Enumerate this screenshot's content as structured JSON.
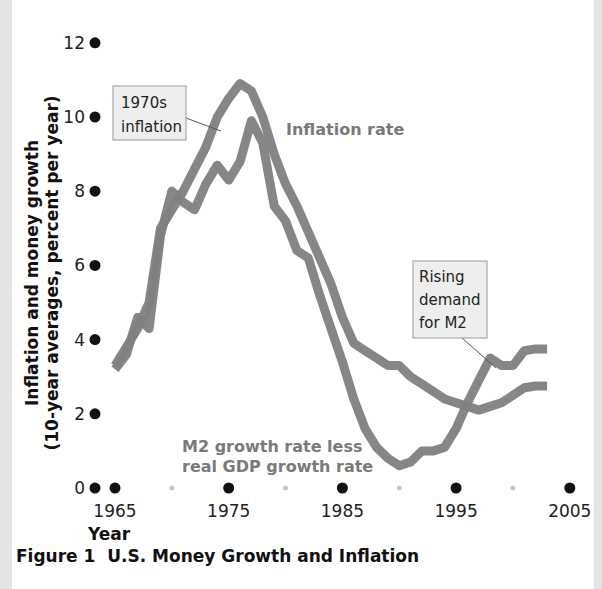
{
  "figure_title": "Figure 1  U.S. Money Growth and Inflation",
  "colors": {
    "line": "#808080",
    "major_dot": "#111111",
    "minor_dot": "#c8c8c8",
    "callout_fill": "#eeeeee",
    "callout_border": "#999999",
    "series_label": "#7a7a7a"
  },
  "chart_data": {
    "type": "line",
    "title": "U.S. Money Growth and Inflation",
    "xlabel": "Year",
    "ylabel": "Inflation and money growth (10-year averages, percent per year)",
    "ylabel_lines": [
      "Inflation and money growth",
      "(10-year averages, percent per year)"
    ],
    "xlim": [
      1963.3,
      2005
    ],
    "ylim": [
      0,
      12
    ],
    "yticks": [
      0,
      2,
      4,
      6,
      8,
      10,
      12
    ],
    "ytick_labels": [
      "0",
      "2",
      "4",
      "6",
      "8",
      "10",
      "12"
    ],
    "xticks_major": [
      1965,
      1975,
      1985,
      1995,
      2005
    ],
    "xtick_labels": [
      "1965",
      "1975",
      "1985",
      "1995",
      "2005"
    ],
    "xticks_minor": [
      1970,
      1980,
      1990,
      2000
    ],
    "grid": false,
    "series": [
      {
        "name": "Inflation rate",
        "label_lines": [
          "Inflation rate"
        ],
        "x": [
          1965,
          1966,
          1967,
          1968,
          1969,
          1970,
          1971,
          1972,
          1973,
          1974,
          1975,
          1976,
          1977,
          1978,
          1979,
          1980,
          1981,
          1982,
          1983,
          1984,
          1985,
          1986,
          1987,
          1988,
          1989,
          1990,
          1991,
          1992,
          1993,
          1994,
          1995,
          1996,
          1997,
          1998,
          1999,
          2000,
          2001,
          2002,
          2003
        ],
        "values": [
          3.3,
          3.8,
          4.3,
          5.0,
          7.0,
          7.5,
          8.0,
          8.6,
          9.2,
          10.0,
          10.5,
          10.9,
          10.7,
          10.0,
          9.0,
          8.2,
          7.6,
          6.9,
          6.2,
          5.5,
          4.6,
          3.9,
          3.7,
          3.5,
          3.3,
          3.3,
          3.0,
          2.8,
          2.6,
          2.4,
          2.3,
          2.2,
          2.1,
          2.2,
          2.3,
          2.5,
          2.7,
          2.75,
          2.75
        ]
      },
      {
        "name": "M2 growth rate less real GDP growth rate",
        "label_lines": [
          "M2 growth rate less",
          "real GDP growth rate"
        ],
        "x": [
          1965,
          1966,
          1967,
          1968,
          1969,
          1970,
          1971,
          1972,
          1973,
          1974,
          1975,
          1976,
          1977,
          1978,
          1979,
          1980,
          1981,
          1982,
          1983,
          1984,
          1985,
          1986,
          1987,
          1988,
          1989,
          1990,
          1991,
          1992,
          1993,
          1994,
          1995,
          1996,
          1997,
          1998,
          1999,
          2000,
          2001,
          2002,
          2003
        ],
        "values": [
          3.2,
          3.6,
          4.6,
          4.3,
          6.8,
          8.0,
          7.7,
          7.5,
          8.2,
          8.7,
          8.3,
          8.8,
          9.9,
          9.3,
          7.6,
          7.2,
          6.4,
          6.2,
          5.2,
          4.3,
          3.4,
          2.4,
          1.6,
          1.1,
          0.8,
          0.6,
          0.7,
          1.0,
          1.0,
          1.1,
          1.6,
          2.3,
          2.9,
          3.5,
          3.3,
          3.3,
          3.7,
          3.75,
          3.75
        ]
      }
    ],
    "annotations": [
      {
        "id": "callout-1970s",
        "lines": [
          "1970s",
          "inflation"
        ],
        "points_to_year": 1975.7,
        "points_to_value": 9.9
      },
      {
        "id": "callout-m2-demand",
        "lines": [
          "Rising",
          "demand",
          "for M2"
        ],
        "points_to_year": 1997.2,
        "points_to_value": 3.5
      }
    ]
  }
}
